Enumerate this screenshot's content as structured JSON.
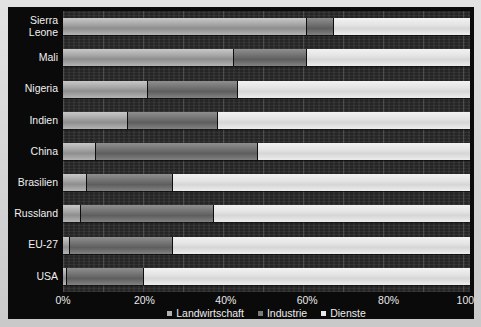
{
  "chart_data": {
    "type": "bar",
    "subtype": "stacked-horizontal-100",
    "title": "",
    "xlabel": "",
    "ylabel": "",
    "xlim": [
      0,
      100
    ],
    "grid": true,
    "legend_position": "bottom",
    "categories": [
      "Sierra\nLeone",
      "Mali",
      "Nigeria",
      "Indien",
      "China",
      "Brasilien",
      "Russland",
      "EU-27",
      "USA"
    ],
    "xtick_labels": [
      "0%",
      "20%",
      "40%",
      "60%",
      "80%",
      "100%"
    ],
    "xtick_values": [
      0,
      20,
      40,
      60,
      80,
      100
    ],
    "series": [
      {
        "name": "Landwirtschaft",
        "color": "#a6a6a6",
        "values": [
          60,
          42,
          21,
          16,
          8,
          6,
          4.5,
          1.7,
          1
        ]
      },
      {
        "name": "Industrie",
        "color": "#707070",
        "values": [
          6.5,
          18,
          22,
          22,
          40,
          21,
          32.5,
          25.3,
          19
        ]
      },
      {
        "name": "Dienste",
        "color": "#e4e4e4",
        "values": [
          33.5,
          40,
          57,
          62,
          52,
          73,
          63,
          73,
          80
        ]
      }
    ],
    "legend": [
      {
        "label": "Landwirtschaft",
        "marker": "square-marker",
        "color": "#b0b0b0"
      },
      {
        "label": "Industrie",
        "marker": "square-marker",
        "color": "#7a7a7a"
      },
      {
        "label": "Dienste",
        "marker": "square-marker",
        "color": "#e8e8e8"
      }
    ],
    "colors": {
      "background": "#0a0a0a",
      "plot_background": "#272727",
      "text": "#f0f0f0",
      "agriculture": "#a6a6a6",
      "industry": "#707070",
      "services": "#e4e4e4"
    }
  }
}
